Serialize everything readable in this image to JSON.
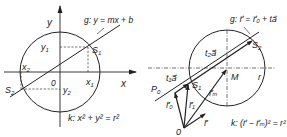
{
  "left_diagram": {
    "axis_x_label": "x",
    "axis_y_label": "y",
    "origin_label": "0",
    "line_label": "g: y = mx + b",
    "circle_label": "k: x² + y² = r²",
    "intersection_1": "S",
    "intersection_1_sub": "1",
    "intersection_2": "S",
    "intersection_2_sub": "2",
    "x1": "x",
    "x1_sub": "1",
    "y1": "y",
    "y1_sub": "1",
    "x2": "x",
    "x2_sub": "2",
    "y2": "y",
    "y2_sub": "2"
  },
  "right_diagram": {
    "origin_label": "0",
    "center_label": "M",
    "radius_label": "r",
    "point_p0": "P",
    "point_p0_sub": "0",
    "line_label": "g: r⃗ = r⃗₀ + ta⃗",
    "circle_label": "k: (r⃗ − r⃗ₘ)² = r²",
    "intersection_1": "S",
    "intersection_1_sub": "1",
    "intersection_2": "S",
    "intersection_2_sub": "2",
    "vec_t1a": "t₁a⃗",
    "vec_t2a": "t₂a⃗",
    "vec_r0": "r⃗₀",
    "vec_r1": "r⃗₁",
    "vec_rm": "r⃗ₘ",
    "vec_r": "r⃗"
  },
  "colors": {
    "stroke": "#222222",
    "background": "#ffffff"
  }
}
